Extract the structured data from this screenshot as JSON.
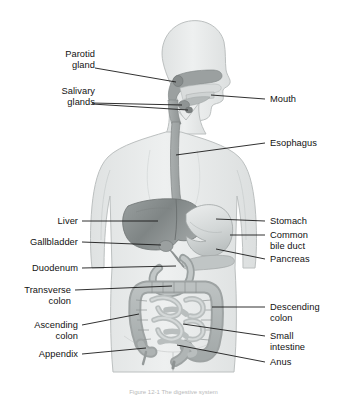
{
  "figure": {
    "caption": "Figure 12-1 The digestive system",
    "background_color": "#ffffff",
    "text_color": "#121212",
    "leader_line_color": "#1a1a1a",
    "body_silhouette_color": "#e8eaea",
    "body_outline_color": "#b9bdbd",
    "organ_light_color": "#c9cdcd",
    "organ_mid_color": "#b0b5b5",
    "organ_dark_color": "#8b9090",
    "liver_color": "#8f9494",
    "stomach_color": "#d7dbdb"
  },
  "labels": {
    "left": [
      {
        "name": "parotid-gland",
        "text": "Parotid\ngland"
      },
      {
        "name": "salivary-glands",
        "text": "Salivary\nglands"
      },
      {
        "name": "liver",
        "text": "Liver"
      },
      {
        "name": "gallbladder",
        "text": "Gallbladder"
      },
      {
        "name": "duodenum",
        "text": "Duodenum"
      },
      {
        "name": "transverse-colon",
        "text": "Transverse\ncolon"
      },
      {
        "name": "ascending-colon",
        "text": "Ascending\ncolon"
      },
      {
        "name": "appendix",
        "text": "Appendix"
      }
    ],
    "right": [
      {
        "name": "mouth",
        "text": "Mouth"
      },
      {
        "name": "esophagus",
        "text": "Esophagus"
      },
      {
        "name": "stomach",
        "text": "Stomach"
      },
      {
        "name": "common-bile-duct",
        "text": "Common\nbile duct"
      },
      {
        "name": "pancreas",
        "text": "Pancreas"
      },
      {
        "name": "descending-colon",
        "text": "Descending\ncolon"
      },
      {
        "name": "small-intestine",
        "text": "Small\nintestine"
      },
      {
        "name": "anus",
        "text": "Anus"
      }
    ]
  },
  "label_text": {
    "parotid_gland_l1": "Parotid",
    "parotid_gland_l2": "gland",
    "salivary_glands_l1": "Salivary",
    "salivary_glands_l2": "glands",
    "liver": "Liver",
    "gallbladder": "Gallbladder",
    "duodenum": "Duodenum",
    "transverse_colon_l1": "Transverse",
    "transverse_colon_l2": "colon",
    "ascending_colon_l1": "Ascending",
    "ascending_colon_l2": "colon",
    "appendix": "Appendix",
    "mouth": "Mouth",
    "esophagus": "Esophagus",
    "stomach": "Stomach",
    "common_bile_duct_l1": "Common",
    "common_bile_duct_l2": "bile duct",
    "pancreas": "Pancreas",
    "descending_colon_l1": "Descending",
    "descending_colon_l2": "colon",
    "small_intestine_l1": "Small",
    "small_intestine_l2": "intestine",
    "anus": "Anus",
    "caption": "Figure 12-1 The digestive system"
  }
}
